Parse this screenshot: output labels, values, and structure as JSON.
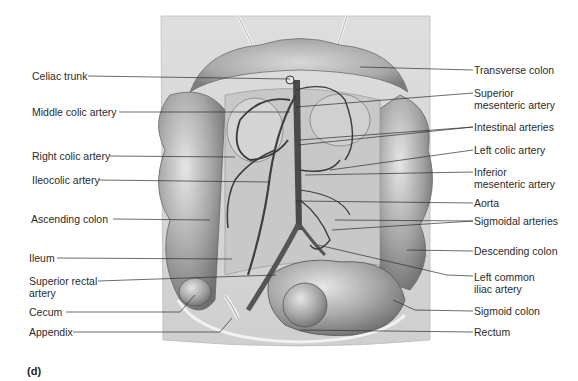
{
  "figure": {
    "panel_letter": "(d)",
    "labels_left": [
      {
        "id": "celiac-trunk",
        "text": "Celiac trunk"
      },
      {
        "id": "middle-colic-artery",
        "text": "Middle colic artery"
      },
      {
        "id": "right-colic-artery",
        "text": "Right colic artery"
      },
      {
        "id": "ileocolic-artery",
        "text": "Ileocolic artery"
      },
      {
        "id": "ascending-colon",
        "text": "Ascending colon"
      },
      {
        "id": "ileum",
        "text": "Ileum"
      },
      {
        "id": "superior-rectal-artery",
        "line1": "Superior rectal",
        "line2": "artery"
      },
      {
        "id": "cecum",
        "text": "Cecum"
      },
      {
        "id": "appendix",
        "text": "Appendix"
      }
    ],
    "labels_right": [
      {
        "id": "transverse-colon",
        "text": "Transverse colon"
      },
      {
        "id": "superior-mesenteric-artery",
        "line1": "Superior",
        "line2": "mesenteric artery"
      },
      {
        "id": "intestinal-arteries",
        "text": "Intestinal arteries"
      },
      {
        "id": "left-colic-artery",
        "text": "Left colic artery"
      },
      {
        "id": "inferior-mesenteric-artery",
        "line1": "Inferior",
        "line2": "mesenteric artery"
      },
      {
        "id": "aorta",
        "text": "Aorta"
      },
      {
        "id": "sigmoidal-arteries",
        "text": "Sigmoidal arteries"
      },
      {
        "id": "descending-colon",
        "text": "Descending colon"
      },
      {
        "id": "left-common-iliac-artery",
        "line1": "Left common",
        "line2": "iliac artery"
      },
      {
        "id": "sigmoid-colon",
        "text": "Sigmoid colon"
      },
      {
        "id": "rectum",
        "text": "Rectum"
      }
    ]
  }
}
